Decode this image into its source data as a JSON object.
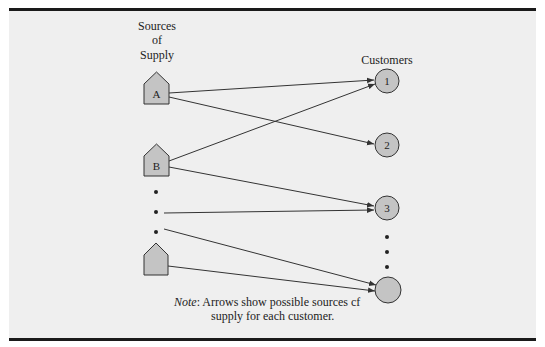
{
  "diagram": {
    "sources_heading": [
      "Sources",
      "of",
      "Supply"
    ],
    "customers_heading": "Customers",
    "sources": [
      {
        "id": "A",
        "label": "A"
      },
      {
        "id": "B",
        "label": "B"
      },
      {
        "id": "last",
        "label": ""
      }
    ],
    "customers": [
      {
        "id": "1",
        "label": "1"
      },
      {
        "id": "2",
        "label": "2"
      },
      {
        "id": "3",
        "label": "3"
      },
      {
        "id": "last",
        "label": ""
      }
    ],
    "edges": [
      {
        "from": "A",
        "to": "1"
      },
      {
        "from": "A",
        "to": "2"
      },
      {
        "from": "B",
        "to": "1"
      },
      {
        "from": "B",
        "to": "3"
      },
      {
        "from": "source-ellipsis",
        "to": "3"
      },
      {
        "from": "source-ellipsis",
        "to": "last"
      },
      {
        "from": "last",
        "to": "last"
      }
    ],
    "colors": {
      "node_fill": "#c4c4c4",
      "stroke": "#333333",
      "background": "#efefef",
      "border": "#1a1a1a"
    }
  },
  "note": {
    "label": "Note",
    "line1": ": Arrows show possible sources cf",
    "line2": "supply for each customer."
  }
}
